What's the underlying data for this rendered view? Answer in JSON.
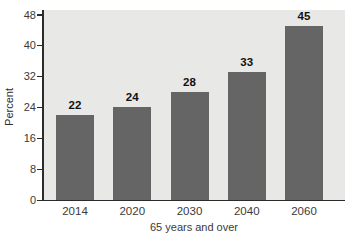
{
  "chart_data": {
    "type": "bar",
    "categories": [
      "2014",
      "2020",
      "2030",
      "2040",
      "2060"
    ],
    "values": [
      22,
      24,
      28,
      33,
      45
    ],
    "value_labels": [
      "22",
      "24",
      "28",
      "33",
      "45"
    ],
    "title": "",
    "xlabel": "65 years and over",
    "ylabel": "Percent",
    "ylim": [
      0,
      48
    ],
    "yticks": [
      0,
      8,
      16,
      24,
      32,
      40,
      48
    ],
    "grid": false,
    "legend_position": "none",
    "colors": {
      "bar": "#656565",
      "plot_background": "#e8e8e6",
      "page_background": "#ffffff",
      "axis": "#2b2b2b",
      "tick_text": "#3a3a3a",
      "value_label_text": "#111111"
    }
  }
}
